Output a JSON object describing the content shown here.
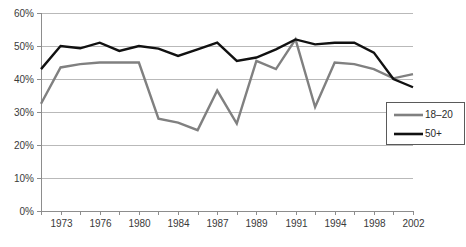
{
  "chart_data": {
    "type": "line",
    "title": "",
    "subtitle": "",
    "xlabel": "",
    "ylabel": "",
    "ylim": [
      0,
      60
    ],
    "grid": true,
    "legend_position": "right",
    "y_tick_labels": [
      "60%",
      "50%",
      "40%",
      "30%",
      "20%",
      "10%",
      "0%"
    ],
    "y_tick_values": [
      60,
      50,
      40,
      30,
      20,
      10,
      0
    ],
    "x": [
      1972,
      1973,
      1974,
      1976,
      1978,
      1980,
      1982,
      1984,
      1985,
      1987,
      1988,
      1989,
      1990,
      1991,
      1992,
      1994,
      1996,
      1998,
      2000,
      2002
    ],
    "x_tick_labels": [
      "",
      "1973",
      "",
      "1976",
      "",
      "1980",
      "",
      "1984",
      "",
      "1987",
      "",
      "1989",
      "",
      "1991",
      "",
      "1994",
      "",
      "1998",
      "",
      "2002"
    ],
    "x_visible_labels": [
      "1973",
      "1976",
      "1980",
      "1984",
      "1987",
      "1989",
      "1991",
      "1994",
      "1998",
      "2002"
    ],
    "series": [
      {
        "name": "18–20",
        "color": "#808080",
        "width": 2.4,
        "values": [
          32.5,
          43.5,
          44.5,
          45.0,
          45.0,
          45.0,
          28.0,
          26.8,
          24.5,
          36.5,
          26.5,
          45.5,
          43.0,
          52.0,
          31.5,
          45.0,
          44.5,
          43.0,
          40.2,
          41.5
        ]
      },
      {
        "name": "50+",
        "color": "#111111",
        "width": 2.4,
        "values": [
          43.0,
          50.0,
          49.3,
          51.0,
          48.5,
          50.0,
          49.2,
          47.0,
          49.0,
          51.0,
          45.5,
          46.5,
          49.0,
          52.0,
          50.5,
          51.0,
          51.0,
          48.0,
          40.0,
          37.5
        ]
      }
    ],
    "legend": [
      {
        "label": "18–20",
        "color": "#808080"
      },
      {
        "label": "50+",
        "color": "#111111"
      }
    ]
  },
  "axes": {
    "y_axis_name": "percent-axis",
    "x_axis_name": "year-axis"
  }
}
